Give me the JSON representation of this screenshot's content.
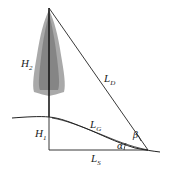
{
  "diagram": {
    "labels": {
      "H2": {
        "main": "H",
        "sub": "2"
      },
      "H1": {
        "main": "H",
        "sub": "1"
      },
      "LD": {
        "main": "L",
        "sub": "D"
      },
      "LG": {
        "main": "L",
        "sub": "G"
      },
      "LS": {
        "main": "L",
        "sub": "S"
      },
      "alpha": "α",
      "beta": "β"
    },
    "colors": {
      "line": "#222222",
      "tree_foliage": "#8a8a8a",
      "tree_trunk": "#1a1a1a"
    }
  }
}
